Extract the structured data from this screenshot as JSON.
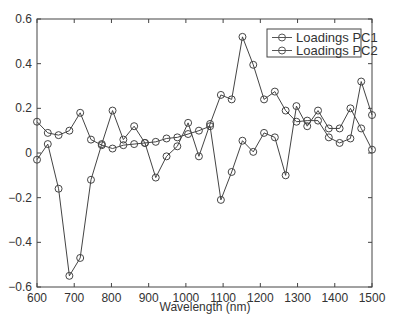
{
  "chart_data": {
    "type": "line",
    "title": "",
    "xlabel": "Wavelength (nm)",
    "ylabel": "",
    "xlim": [
      600,
      1500
    ],
    "ylim": [
      -0.6,
      0.6
    ],
    "xticks": [
      600,
      700,
      800,
      900,
      1000,
      1100,
      1200,
      1300,
      1400,
      1500
    ],
    "yticks": [
      -0.6,
      -0.4,
      -0.2,
      0,
      0.2,
      0.4,
      0.6
    ],
    "xtick_labels": [
      "600",
      "700",
      "800",
      "900",
      "1000",
      "1100",
      "1200",
      "1300",
      "1400",
      "1500"
    ],
    "ytick_labels": [
      "−0.6",
      "−0.4",
      "−0.2",
      "0",
      "0.2",
      "0.4",
      "0.6"
    ],
    "grid": false,
    "legend_position": "upper right",
    "marker": "circle",
    "x": [
      600,
      629,
      658,
      687,
      716,
      745,
      774,
      803,
      832,
      861,
      890,
      919,
      948,
      977,
      1006,
      1035,
      1065,
      1094,
      1123,
      1152,
      1181,
      1210,
      1239,
      1268,
      1297,
      1326,
      1355,
      1384,
      1413,
      1442,
      1471,
      1500
    ],
    "series": [
      {
        "name": "Loadings PC1",
        "values": [
          -0.03,
          0.04,
          -0.16,
          -0.55,
          -0.47,
          -0.12,
          0.04,
          0.19,
          0.06,
          0.12,
          0.045,
          -0.11,
          -0.015,
          0.03,
          0.135,
          -0.015,
          0.13,
          0.26,
          0.24,
          0.52,
          0.395,
          0.24,
          0.275,
          0.19,
          0.14,
          0.145,
          0.145,
          0.07,
          0.045,
          0.065,
          0.32,
          0.17
        ]
      },
      {
        "name": "Loadings PC2",
        "values": [
          0.14,
          0.09,
          0.08,
          0.1,
          0.18,
          0.06,
          0.035,
          0.02,
          0.035,
          0.04,
          0.045,
          0.05,
          0.065,
          0.07,
          0.085,
          0.1,
          0.12,
          -0.21,
          -0.085,
          0.055,
          0.005,
          0.09,
          0.07,
          -0.1,
          0.21,
          0.12,
          0.19,
          0.11,
          0.11,
          0.2,
          0.11,
          0.015
        ]
      }
    ]
  },
  "legend": {
    "items": [
      "Loadings PC1",
      "Loadings PC2"
    ]
  },
  "colors": {
    "line": "#444444",
    "axis": "#444444",
    "text": "#333333"
  }
}
